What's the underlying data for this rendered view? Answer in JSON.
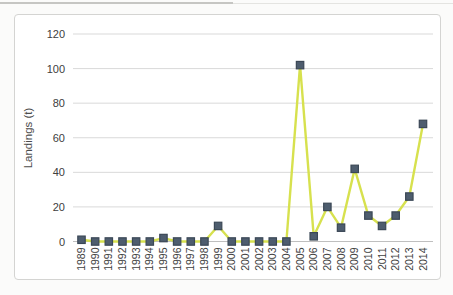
{
  "chart_data": {
    "type": "line",
    "title": "",
    "xlabel": "",
    "ylabel": "Landings (t)",
    "categories": [
      "1989",
      "1990",
      "1991",
      "1992",
      "1993",
      "1994",
      "1995",
      "1996",
      "1997",
      "1998",
      "1999",
      "2000",
      "2001",
      "2002",
      "2003",
      "2004",
      "2005",
      "2006",
      "2007",
      "2008",
      "2009",
      "2010",
      "2011",
      "2012",
      "2013",
      "2014"
    ],
    "values": [
      1,
      0,
      0,
      0,
      0,
      0,
      2,
      0,
      0,
      0,
      9,
      0,
      0,
      0,
      0,
      0,
      102,
      3,
      20,
      8,
      42,
      15,
      9,
      15,
      26,
      68
    ],
    "ylim": [
      0,
      120
    ],
    "yticks": [
      0,
      20,
      40,
      60,
      80,
      100,
      120
    ],
    "grid": true,
    "legend": "none",
    "marker_shape": "square",
    "colors": {
      "line": "#d7e14e",
      "marker_fill": "#4e5d6e",
      "marker_stroke": "#3b4856",
      "gridline": "#d9d9d9",
      "axis_line": "#bfbfbf",
      "tick_label": "#404040",
      "axis_title": "#4d4d4d"
    }
  }
}
